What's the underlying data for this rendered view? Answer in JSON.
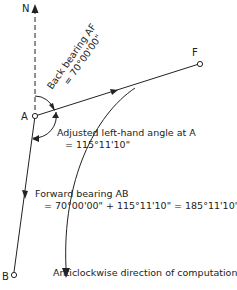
{
  "diagram": {
    "type": "survey-bearing-diagram",
    "points": {
      "north": "N",
      "a": "A",
      "b": "B",
      "f": "F"
    },
    "labels": {
      "back_bearing_line1": "Back bearing AF",
      "back_bearing_line2": "= 70°00'00\"",
      "angle_line1": "Adjusted left-hand angle at A",
      "angle_line2": "= 115°11'10\"",
      "forward_line1": "Forward bearing AB",
      "forward_line2": "= 70°00'00\" + 115°11'10\" = 185°11'10\"",
      "direction": "Anticlockwise direction of computation"
    },
    "values": {
      "back_bearing_af": "70°00'00\"",
      "left_hand_angle_a": "115°11'10\"",
      "forward_bearing_ab": "185°11'10\""
    },
    "colors": {
      "line": "#222222",
      "background": "#ffffff"
    }
  }
}
